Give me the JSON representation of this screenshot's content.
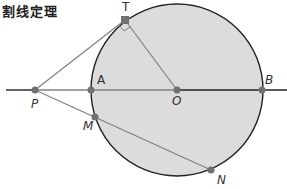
{
  "title": "割线定理",
  "colors": {
    "circle_fill": "#dcdcdc",
    "circle_stroke": "#222222",
    "line": "#808080",
    "diameter": "#222222",
    "point": "#707070"
  },
  "points": {
    "T": {
      "label": "T",
      "x": 125,
      "y": 20
    },
    "P": {
      "label": "P",
      "x": 35,
      "y": 90
    },
    "A": {
      "label": "A",
      "x": 91,
      "y": 90
    },
    "O": {
      "label": "O",
      "x": 177,
      "y": 90
    },
    "B": {
      "label": "B",
      "x": 262,
      "y": 90
    },
    "M": {
      "label": "M",
      "x": 95,
      "y": 117
    },
    "N": {
      "label": "N",
      "x": 211,
      "y": 170
    }
  },
  "circle": {
    "cx": 177,
    "cy": 90,
    "r": 86
  }
}
